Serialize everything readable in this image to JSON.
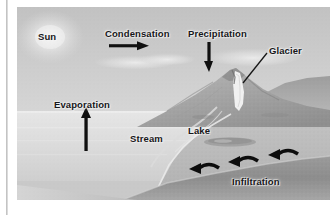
{
  "figure": {
    "style": "grayscale landscape illustration",
    "labels": {
      "sun": "Sun",
      "condensation": "Condensation",
      "precipitation": "Precipitation",
      "glacier": "Glacier",
      "evaporation": "Evaporation",
      "stream": "Stream",
      "lake": "Lake",
      "infiltration": "Infiltration"
    },
    "icons": {
      "condensation_arrow": "arrow-right-icon",
      "precipitation_arrow": "arrow-down-icon",
      "evaporation_arrow": "arrow-up-icon",
      "glacier_leader": "leader-line-icon",
      "infiltration_arrow_1": "curved-arrow-down-left-icon",
      "infiltration_arrow_2": "curved-arrow-down-left-icon",
      "infiltration_arrow_3": "curved-arrow-down-left-icon"
    },
    "colors": {
      "sky": "#c9c9c9",
      "sun_glow": "#f2f2f2",
      "ocean": "#dcdcdc",
      "land": "#b4b4b4",
      "mountain": "#a8a8a8",
      "glacier_ice": "#f0f0f0",
      "subsurface": "#8e8e8e",
      "label_text": "#17171a",
      "arrow": "#111111",
      "page_background": "#ffffff",
      "left_rule": "#b9b9b9"
    }
  }
}
